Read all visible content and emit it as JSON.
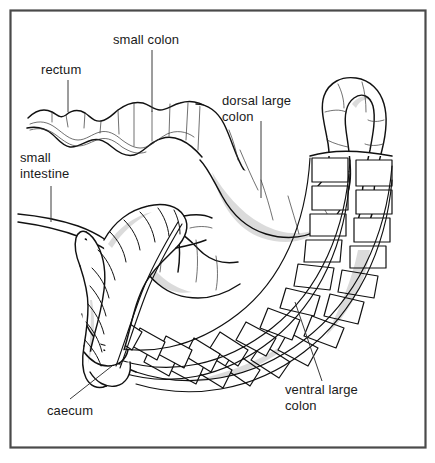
{
  "figure": {
    "kind": "anatomical-line-drawing",
    "border_color": "#4a4a4a",
    "ink_color": "#111111",
    "background_color": "#ffffff",
    "width": 435,
    "height": 463
  },
  "labels": [
    {
      "id": "rectum",
      "name": "label-rectum",
      "lines": [
        "rectum"
      ],
      "text_x": 41,
      "text_y": 74,
      "anchor": "start",
      "leader": "M68,80 L68,112"
    },
    {
      "id": "small-colon",
      "name": "label-small-colon",
      "lines": [
        "small colon"
      ],
      "text_x": 113,
      "text_y": 44,
      "anchor": "start",
      "leader": "M152,50 L152,112"
    },
    {
      "id": "dorsal-large-colon",
      "name": "label-dorsal-large-colon",
      "lines": [
        "dorsal large",
        "colon"
      ],
      "text_x": 222,
      "text_y": 105,
      "anchor": "start",
      "leader": "M261,121 L261,198"
    },
    {
      "id": "small-intestine",
      "name": "label-small-intestine",
      "lines": [
        "small",
        "intestine"
      ],
      "text_x": 20,
      "text_y": 162,
      "anchor": "start",
      "leader": "M51,186 L51,222"
    },
    {
      "id": "ventral-large-colon",
      "name": "label-ventral-large-colon",
      "lines": [
        "ventral large",
        "colon"
      ],
      "text_x": 285,
      "text_y": 394,
      "anchor": "start",
      "leader": "M295,302 L322,381"
    },
    {
      "id": "caecum",
      "name": "label-caecum",
      "lines": [
        "caecum"
      ],
      "text_x": 47,
      "text_y": 415,
      "anchor": "start",
      "leader": "M70,399 L112,366"
    }
  ]
}
